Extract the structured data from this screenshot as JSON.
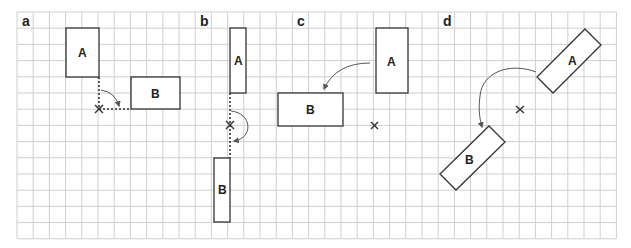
{
  "figure": {
    "grid": {
      "origin_x": 17,
      "origin_y": 12,
      "cell": 16.2,
      "cols": 37,
      "rows": 14,
      "line_color": "#cfcfcf"
    },
    "colors": {
      "shape_stroke": "#333333",
      "arrow": "#555555",
      "background": "#ffffff"
    },
    "panels": [
      {
        "label": "a",
        "description": "Rotation of A to B about a pivot at A's bottom-right corner (90 degrees clockwise), with dotted guide lines",
        "rect_a": {
          "label": "A"
        },
        "rect_b": {
          "label": "B"
        },
        "pivot_marker": "×"
      },
      {
        "label": "b",
        "description": "Rotation of A to B by 180 degrees about a pivot point on the vertical line",
        "rect_a": {
          "label": "A"
        },
        "rect_b": {
          "label": "B"
        },
        "pivot_marker": "×"
      },
      {
        "label": "c",
        "description": "Rotation of A to B by 90 degrees counter-clockwise about a pivot below A",
        "rect_a": {
          "label": "A"
        },
        "rect_b": {
          "label": "B"
        },
        "pivot_marker": "×"
      },
      {
        "label": "d",
        "description": "Rotation of tilted rectangle A to B by 180 degrees about a central pivot",
        "rect_a": {
          "label": "A"
        },
        "rect_b": {
          "label": "B"
        },
        "pivot_marker": "×"
      }
    ]
  }
}
